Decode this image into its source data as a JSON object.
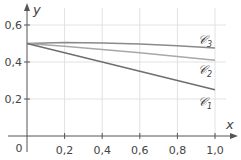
{
  "chart_data": {
    "type": "line",
    "title": "",
    "xlabel": "x",
    "ylabel": "y",
    "xlim": [
      0,
      1.0
    ],
    "ylim": [
      0,
      0.6
    ],
    "grid": true,
    "x_ticks": [
      "0",
      "0,2",
      "0,4",
      "0,6",
      "0,8",
      "1,0"
    ],
    "y_ticks": [
      "0,2",
      "0,4",
      "0,6"
    ],
    "origin_label": "0",
    "x": [
      0,
      0.2,
      0.4,
      0.6,
      0.8,
      1.0
    ],
    "series": [
      {
        "name": "𝒞3",
        "label_main": "𝒞",
        "label_sub": "3",
        "values": [
          0.5,
          0.505,
          0.503,
          0.497,
          0.488,
          0.475
        ],
        "color": "#8a8a8a"
      },
      {
        "name": "𝒞2",
        "label_main": "𝒞",
        "label_sub": "2",
        "values": [
          0.5,
          0.485,
          0.468,
          0.45,
          0.43,
          0.41
        ],
        "color": "#a8a8a8"
      },
      {
        "name": "𝒞1",
        "label_main": "𝒞",
        "label_sub": "1",
        "values": [
          0.5,
          0.45,
          0.4,
          0.35,
          0.3,
          0.25
        ],
        "color": "#6e6e6e"
      }
    ]
  }
}
